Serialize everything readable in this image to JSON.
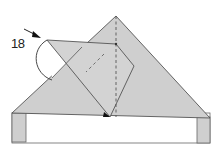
{
  "diagram": {
    "type": "origami-step",
    "step_number": "18",
    "colors": {
      "paper": "#cfcfcf",
      "paper_light": "#d9d9d9",
      "line": "#555555",
      "background": "#ffffff",
      "arrow": "#222222"
    },
    "elements": [
      {
        "name": "base-triangle",
        "kind": "paper-layer"
      },
      {
        "name": "base-band",
        "kind": "paper-strip"
      },
      {
        "name": "folded-flap",
        "kind": "paper-layer"
      },
      {
        "name": "valley-fold-line",
        "kind": "dashed-line"
      },
      {
        "name": "fold-arrow",
        "kind": "curved-arrow"
      },
      {
        "name": "step-pointer-arrow",
        "kind": "arrow"
      }
    ]
  }
}
